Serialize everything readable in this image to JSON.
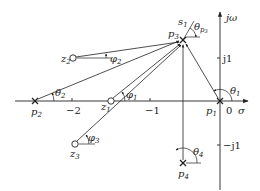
{
  "diagram": {
    "axes": {
      "real_label": "σ",
      "imag_label": "jω",
      "origin_label": "0",
      "real_ticks": [
        {
          "label": "−2",
          "x": 72
        },
        {
          "label": "−1",
          "x": 150
        }
      ],
      "imag_ticks": [
        {
          "label": "j1",
          "y": 58
        },
        {
          "label": "−j1",
          "y": 145
        }
      ]
    },
    "poles": [
      {
        "name": "p1",
        "label": "p",
        "sub": "1",
        "x": 220,
        "y": 101
      },
      {
        "name": "p2",
        "label": "p",
        "sub": "2",
        "x": 35,
        "y": 101
      },
      {
        "name": "p3",
        "label": "p",
        "sub": "3",
        "x": 183,
        "y": 40
      },
      {
        "name": "p4",
        "label": "p",
        "sub": "4",
        "x": 183,
        "y": 163
      }
    ],
    "zeros": [
      {
        "name": "z1",
        "label": "z",
        "sub": "1",
        "x": 111,
        "y": 101
      },
      {
        "name": "z2",
        "label": "z",
        "sub": "2",
        "x": 73,
        "y": 58
      },
      {
        "name": "z3",
        "label": "z",
        "sub": "3",
        "x": 75,
        "y": 144
      }
    ],
    "test_point": {
      "label": "s",
      "sub": "1"
    },
    "angles": {
      "theta1": {
        "sym": "θ",
        "sub": "1"
      },
      "theta2": {
        "sym": "θ",
        "sub": "2"
      },
      "theta4": {
        "sym": "θ",
        "sub": "4"
      },
      "theta_p3": {
        "sym": "θ",
        "sub": "p",
        "subsub": "3"
      },
      "phi1": {
        "sym": "φ",
        "sub": "1"
      },
      "phi2": {
        "sym": "φ",
        "sub": "2"
      },
      "phi3": {
        "sym": "φ",
        "sub": "3"
      }
    },
    "colors": {
      "line": "#222222",
      "background": "#ffffff"
    }
  }
}
